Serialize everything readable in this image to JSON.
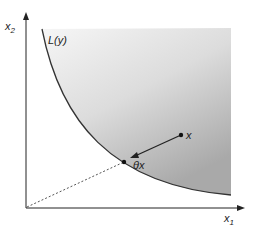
{
  "diagram": {
    "axes": {
      "x_label": "x",
      "x_sub": "1",
      "y_label": "x",
      "y_sub": "2"
    },
    "curve_label": "L(y)",
    "point_x_label": "x",
    "point_thetax_label": "θx",
    "colors": {
      "axis": "#222222",
      "curve": "#333333",
      "shade_light": "#f4f4f4",
      "shade_dark": "#b0b0b0",
      "dashed_ray": "#555555"
    }
  }
}
